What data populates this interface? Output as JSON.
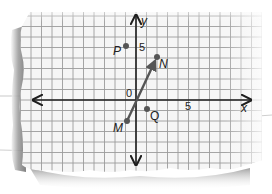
{
  "figure": {
    "axes": {
      "x_label": "x",
      "y_label": "y",
      "origin_label": "0",
      "x_tick_label": "5",
      "y_tick_label": "5"
    },
    "points": [
      {
        "label": "P",
        "x": -1,
        "y": 5
      },
      {
        "label": "N",
        "x": 2,
        "y": 4
      },
      {
        "label": "M",
        "x": -1,
        "y": -2
      },
      {
        "label": "Q",
        "x": 1,
        "y": -1
      }
    ],
    "vector": {
      "from": "M",
      "to": "N"
    },
    "colors": {
      "paper": "#f7f7f7",
      "grid": "#9a9a9a",
      "axis": "#1e1e1e",
      "point": "#555555",
      "vector": "#555555",
      "shadow": "#8a8a8a"
    }
  }
}
